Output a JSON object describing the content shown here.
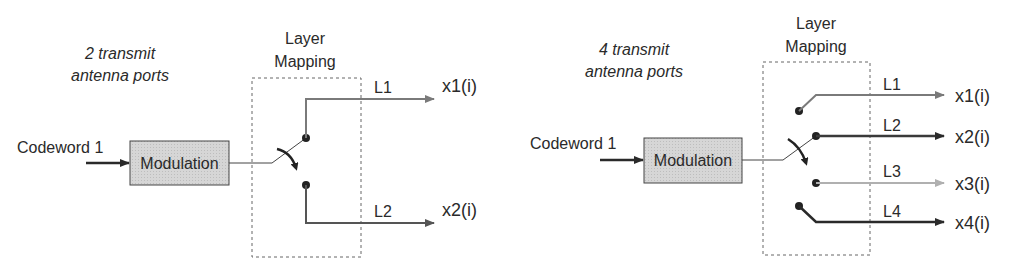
{
  "diagrams": [
    {
      "caption_line1": "2 transmit",
      "caption_line2": "antenna ports",
      "layer_mapping_line1": "Layer",
      "layer_mapping_line2": "Mapping",
      "input_label": "Codeword 1",
      "block_label": "Modulation",
      "layers": [
        {
          "label": "L1",
          "output": "x1(i)",
          "color": "#7a7a7a"
        },
        {
          "label": "L2",
          "output": "x2(i)",
          "color": "#555555"
        }
      ]
    },
    {
      "caption_line1": "4 transmit",
      "caption_line2": "antenna ports",
      "layer_mapping_line1": "Layer",
      "layer_mapping_line2": "Mapping",
      "input_label": "Codeword 1",
      "block_label": "Modulation",
      "layers": [
        {
          "label": "L1",
          "output": "x1(i)",
          "color": "#7a7a7a"
        },
        {
          "label": "L2",
          "output": "x2(i)",
          "color": "#3a3a3a"
        },
        {
          "label": "L3",
          "output": "x3(i)",
          "color": "#b0b0b0"
        },
        {
          "label": "L4",
          "output": "x4(i)",
          "color": "#2a2a2a"
        }
      ]
    }
  ],
  "colors": {
    "block_fill": "#d4d4d4",
    "line": "#3a3a3a",
    "dashed_box": "#666666"
  }
}
